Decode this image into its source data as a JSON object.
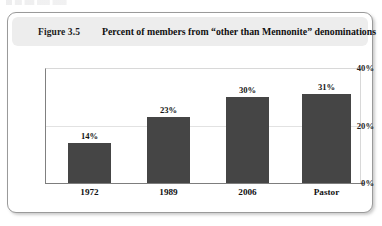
{
  "figure": {
    "number_label": "Figure 3.5",
    "title": "Percent of members from “other than Mennonite” denominations"
  },
  "colors": {
    "bar": "#454545",
    "title_band": "#ededed",
    "card_border": "#9a9a9a",
    "axis": "#7d7d7d",
    "gridline": "#e2e2e2"
  },
  "chart_data": {
    "type": "bar",
    "title": "Percent of members from “other than Mennonite” denominations",
    "xlabel": "",
    "ylabel": "",
    "categories": [
      "1972",
      "1989",
      "2006",
      "Pastor"
    ],
    "values": [
      14,
      23,
      30,
      31
    ],
    "value_labels": [
      "14%",
      "23%",
      "30%",
      "31%"
    ],
    "ylim": [
      0,
      40
    ],
    "yticks": [
      0,
      20,
      40
    ],
    "ytick_labels": [
      "0%",
      "20%",
      "40%"
    ],
    "grid": true,
    "legend": "none",
    "series": [
      {
        "name": "Percent from other than Mennonite denominations",
        "values": [
          14,
          23,
          30,
          31
        ]
      }
    ]
  }
}
